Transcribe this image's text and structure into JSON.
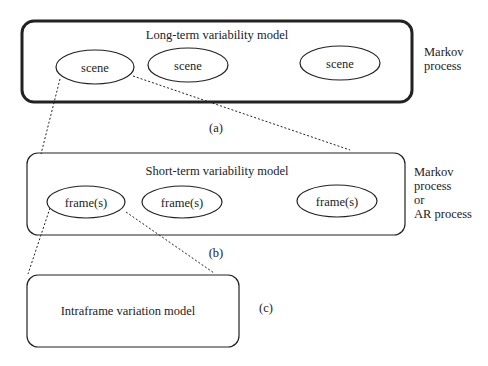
{
  "level_a": {
    "title": "Long-term variability model",
    "nodes": [
      "scene",
      "scene",
      "scene"
    ],
    "process_label_line1": "Markov",
    "process_label_line2": "process",
    "caption": "(a)"
  },
  "level_b": {
    "title": "Short-term variability model",
    "nodes": [
      "frame(s)",
      "frame(s)",
      "frame(s)"
    ],
    "process_label_line1": "Markov",
    "process_label_line2": "process",
    "process_label_line3": "or",
    "process_label_line4": "AR process",
    "caption": "(b)"
  },
  "level_c": {
    "title": "Intraframe variation model",
    "caption": "(c)"
  },
  "colors": {
    "stroke": "#222222",
    "background": "#ffffff"
  }
}
